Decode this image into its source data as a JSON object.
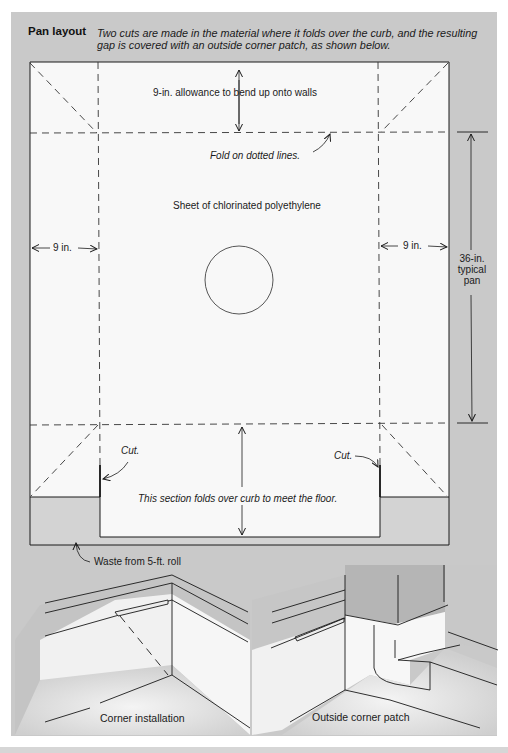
{
  "figure": {
    "title": "Pan layout",
    "caption": "Two cuts are made in the material where it folds over the curb, and the resulting gap is covered with an outside corner patch, as shown below."
  },
  "pan_layout": {
    "labels": {
      "wall_allowance": "9-in. allowance to bend up onto walls",
      "fold_note": "Fold on dotted lines.",
      "sheet": "Sheet of chlorinated polyethylene",
      "left_margin": "9 in.",
      "right_margin": "9 in.",
      "pan_dim_line1": "36-in.",
      "pan_dim_line2": "typical",
      "pan_dim_line3": "pan",
      "cut_left": "Cut.",
      "cut_right": "Cut.",
      "curb_section": "This section folds over curb to meet the floor.",
      "waste": "Waste from 5-ft. roll"
    },
    "features": {
      "drain": "circle-drain",
      "fold_lines": "dashed",
      "corner_folds": "diagonal-dashed"
    }
  },
  "illustrations": [
    {
      "caption": "Corner installation"
    },
    {
      "caption": "Outside corner patch"
    }
  ],
  "colors": {
    "panel_gray": "#c9c9c9",
    "sheet_white": "#f7f7f7",
    "waste_gray": "#d2d2d2",
    "line": "#1a1a1a"
  }
}
